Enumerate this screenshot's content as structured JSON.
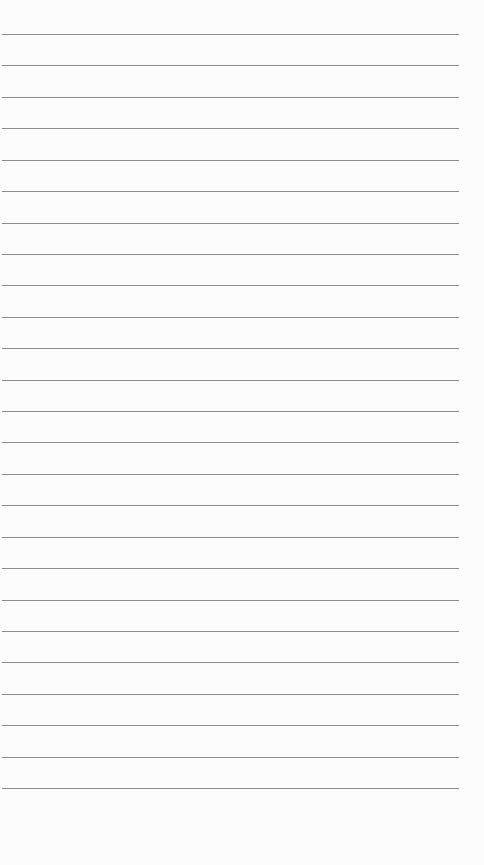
{
  "paper": {
    "background": "#fcfcfc",
    "line_color": "#8c8c8c",
    "line_count": 25,
    "first_line_y": 34,
    "line_spacing": 31.42,
    "line_left": 2,
    "line_width": 457
  }
}
